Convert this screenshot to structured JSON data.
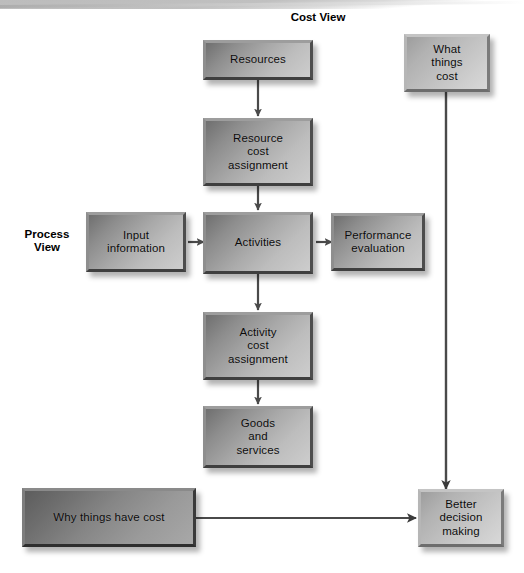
{
  "diagram": {
    "title_cost_view": "Cost View",
    "title_process_view": "Process\nView",
    "labels": {
      "cost_view": "Cost View",
      "process_view_line1": "Process",
      "process_view_line2": "View"
    },
    "nodes": {
      "resources": "Resources",
      "resource_cost_assignment_l1": "Resource",
      "resource_cost_assignment_l2": "cost",
      "resource_cost_assignment_l3": "assignment",
      "input_information_l1": "Input",
      "input_information_l2": "information",
      "activities": "Activities",
      "performance_evaluation_l1": "Performance",
      "performance_evaluation_l2": "evaluation",
      "activity_cost_assignment_l1": "Activity",
      "activity_cost_assignment_l2": "cost",
      "activity_cost_assignment_l3": "assignment",
      "goods_and_services_l1": "Goods",
      "goods_and_services_l2": "and",
      "goods_and_services_l3": "services",
      "what_things_cost_l1": "What",
      "what_things_cost_l2": "things",
      "what_things_cost_l3": "cost",
      "why_things_have_cost": "Why things have cost",
      "better_decision_making_l1": "Better",
      "better_decision_making_l2": "decision",
      "better_decision_making_l3": "making"
    },
    "colors": {
      "box_dark": "#6f6f6f",
      "box_light": "#cdcdcd",
      "arrow": "#4a4a4a",
      "text": "#0b0b0b",
      "background": "#ffffff"
    },
    "edges": [
      {
        "from": "resources",
        "to": "resource_cost_assignment",
        "style": "arrow-down"
      },
      {
        "from": "resource_cost_assignment",
        "to": "activities",
        "style": "arrow-down"
      },
      {
        "from": "input_information",
        "to": "activities",
        "style": "arrow-right"
      },
      {
        "from": "activities",
        "to": "performance_evaluation",
        "style": "arrow-right"
      },
      {
        "from": "activities",
        "to": "activity_cost_assignment",
        "style": "arrow-down"
      },
      {
        "from": "activity_cost_assignment",
        "to": "goods_and_services",
        "style": "arrow-down"
      },
      {
        "from": "what_things_cost",
        "to": "better_decision_making",
        "style": "arrow-down-long"
      },
      {
        "from": "why_things_have_cost",
        "to": "better_decision_making",
        "style": "arrow-right-long"
      }
    ]
  }
}
